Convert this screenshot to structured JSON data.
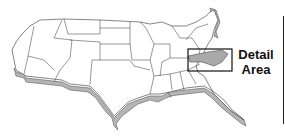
{
  "map": {
    "subject": "Contiguous United States (3D relief outline)",
    "highlighted_region": "North Carolina",
    "highlight_color": "#a9a9a9",
    "extrusion_color": "#b5b5b5",
    "outline_color": "#333333",
    "fill_color": "#ffffff"
  },
  "callout": {
    "line1": "Detail",
    "line2": "Area"
  }
}
